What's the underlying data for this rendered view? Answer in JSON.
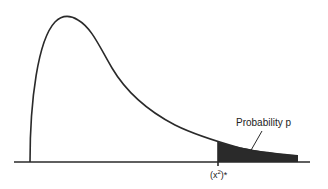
{
  "diagram": {
    "labels": {
      "probability": "Probability p",
      "critical_value_base": "(x",
      "critical_value_sup": "2",
      "critical_value_tail": ")*"
    },
    "colors": {
      "curve": "#2a2a2a",
      "shade": "#2a2a2a",
      "background": "#ffffff"
    }
  }
}
